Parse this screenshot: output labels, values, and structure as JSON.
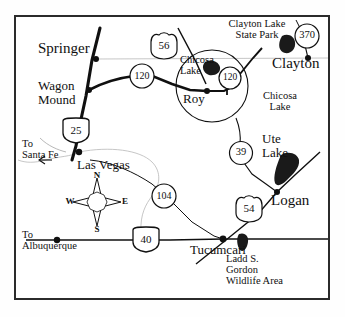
{
  "map": {
    "title": "Northeastern New Mexico Highway Map",
    "region": "Northeastern New Mexico",
    "frame_color": "#2b2b2b",
    "background_color": "#ffffff",
    "ink_color": "#101010",
    "water_color": "#1a1a1a"
  },
  "towns": [
    {
      "name": "Springer",
      "x": 38,
      "y": 48,
      "size": "lg",
      "dot": true,
      "dot_x": 96,
      "dot_y": 59
    },
    {
      "name": "Wagon\nMound",
      "x": 38,
      "y": 84,
      "size": "md",
      "dot": true,
      "dot_x": 89,
      "dot_y": 90
    },
    {
      "name": "Clayton",
      "x": 272,
      "y": 63,
      "size": "lg",
      "dot": true,
      "dot_x": 308,
      "dot_y": 58
    },
    {
      "name": "Roy",
      "x": 183,
      "y": 97,
      "size": "md",
      "dot": true,
      "dot_x": 207,
      "dot_y": 91
    },
    {
      "name": "Las Vegas",
      "x": 77,
      "y": 163,
      "size": "md",
      "dot": true,
      "dot_x": 79,
      "dot_y": 152
    },
    {
      "name": "Logan",
      "x": 271,
      "y": 199,
      "size": "lg",
      "dot": true,
      "dot_x": 277,
      "dot_y": 192
    },
    {
      "name": "Tucumcari",
      "x": 190,
      "y": 248,
      "size": "md",
      "dot": true,
      "dot_x": 223,
      "dot_y": 239
    }
  ],
  "places": [
    {
      "name": "Clayton Lake\nState Park",
      "x": 211,
      "y": 22,
      "style": "small"
    },
    {
      "name": "Chicosa\nLake",
      "x": 180,
      "y": 57,
      "style": "small"
    },
    {
      "name": "Chicosa\nLake",
      "x": 253,
      "y": 93,
      "style": "small"
    },
    {
      "name": "Ute\nLake",
      "x": 262,
      "y": 138,
      "style": "town"
    },
    {
      "name": "Ladd S.\nGordon\nWildlife Area",
      "x": 226,
      "y": 257,
      "style": "small"
    }
  ],
  "offmap_labels": [
    {
      "name": "To\nSanta Fe",
      "x": 22,
      "y": 143
    },
    {
      "name": "To\nAlbuquerque",
      "x": 22,
      "y": 233
    }
  ],
  "shields": [
    {
      "route": "25",
      "type": "interstate",
      "x": 76,
      "y": 131
    },
    {
      "route": "40",
      "type": "interstate",
      "x": 146,
      "y": 240
    },
    {
      "route": "56",
      "type": "us",
      "x": 164,
      "y": 46
    },
    {
      "route": "54",
      "type": "us",
      "x": 249,
      "y": 209
    },
    {
      "route": "120",
      "type": "state",
      "x": 142,
      "y": 76
    },
    {
      "route": "120",
      "type": "state",
      "x": 230,
      "y": 78
    },
    {
      "route": "370",
      "type": "state",
      "x": 307,
      "y": 36
    },
    {
      "route": "39",
      "type": "state",
      "x": 241,
      "y": 153
    },
    {
      "route": "104",
      "type": "state",
      "x": 164,
      "y": 196
    }
  ],
  "compass": {
    "north": "N",
    "south": "S",
    "east": "E",
    "west": "W",
    "center_x": 97,
    "center_y": 202
  },
  "water_bodies": [
    {
      "name": "Clayton Lake",
      "x": 287,
      "y": 44
    },
    {
      "name": "Chicosa Lake",
      "x": 210,
      "y": 66
    },
    {
      "name": "Ute Lake",
      "x": 288,
      "y": 172
    },
    {
      "name": "Ladd Gordon",
      "x": 243,
      "y": 242
    }
  ]
}
